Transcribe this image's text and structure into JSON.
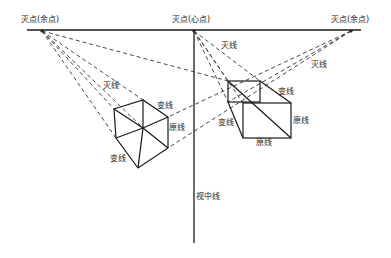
{
  "diagram": {
    "vanishing_points": {
      "left": {
        "label": "灭点(余点)",
        "x": 42,
        "y": 31
      },
      "center": {
        "label": "灭点(心点)",
        "x": 194,
        "y": 31
      },
      "right": {
        "label": "灭点(余点)",
        "x": 351,
        "y": 31
      }
    },
    "horizon_line": {
      "x1": 27,
      "x2": 361,
      "y": 30
    },
    "sight_line": {
      "label": "视中线",
      "x": 194,
      "y1": 31,
      "y2": 243
    },
    "labels": {
      "vanish_line": "灭线",
      "change_line": "变线",
      "original_line": "原线"
    },
    "left_cube": {
      "labels": [
        "灭线",
        "变线",
        "原线",
        "变线"
      ]
    },
    "right_cube": {
      "labels": [
        "灭线",
        "灭线",
        "变线",
        "变线",
        "原线",
        "原线"
      ]
    },
    "colors": {
      "line": "#1a1a1a",
      "dash": "#333333",
      "background": "#ffffff"
    }
  }
}
